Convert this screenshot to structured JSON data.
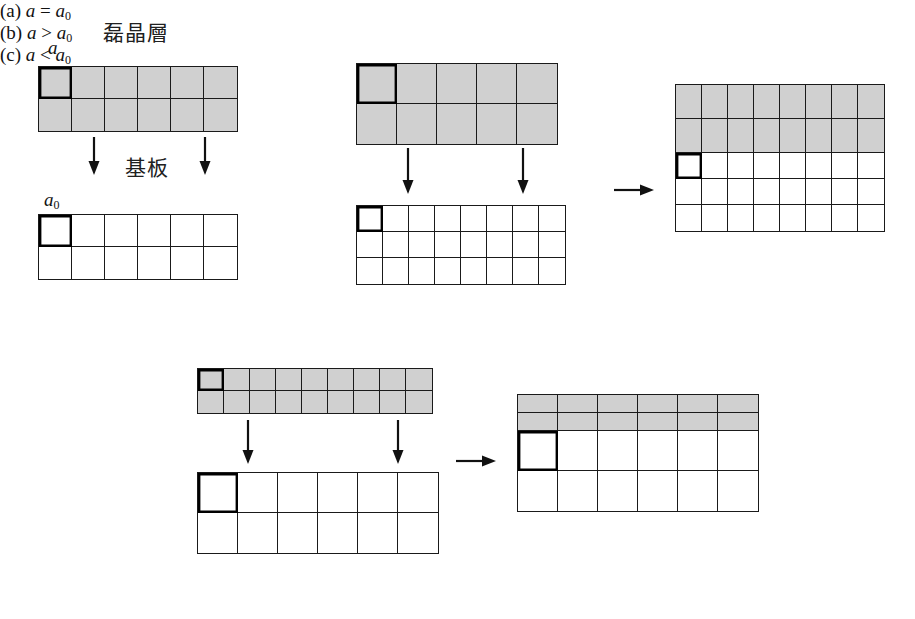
{
  "figure": {
    "labels": {
      "epilayer": "磊晶層",
      "substrate": "基板",
      "a": "a",
      "a0": "a",
      "a0_sub": "0"
    },
    "captions": {
      "a": {
        "tag": "(a)",
        "expr_left": "a",
        "op": "=",
        "expr_right": "a",
        "sub": "0"
      },
      "b": {
        "tag": "(b)",
        "expr_left": "a",
        "op": ">",
        "expr_right": "a",
        "sub": "0"
      },
      "c": {
        "tag": "(c)",
        "expr_left": "a",
        "op": "<",
        "expr_right": "a",
        "sub": "0"
      }
    },
    "colors": {
      "epilayer_fill": "#d0d0d0",
      "substrate_fill": "#ffffff",
      "line": "#1a1a1a",
      "marked_cell_outline": "#000000",
      "background": "#ffffff"
    },
    "panels": [
      {
        "id": "a",
        "caption": "(a) a = a0",
        "meaning": "lattice matched epitaxy",
        "grids": [
          {
            "role": "epilayer",
            "cols": 6,
            "rows": 2,
            "fill": "gray",
            "cell_w": 33,
            "cell_h": 32,
            "marked_cell": [
              0,
              0
            ],
            "x": 38,
            "y": 66
          },
          {
            "role": "substrate",
            "cols": 6,
            "rows": 2,
            "fill": "white",
            "cell_w": 33,
            "cell_h": 32,
            "marked_cell": [
              0,
              0
            ],
            "x": 38,
            "y": 214
          }
        ],
        "arrows": [
          {
            "type": "down",
            "x": 86,
            "y": 137,
            "len": 38
          },
          {
            "type": "down",
            "x": 197,
            "y": 137,
            "len": 38
          }
        ]
      },
      {
        "id": "b",
        "caption": "(b) a > a0",
        "meaning": "epilayer lattice larger than substrate, compressive strain",
        "grids": [
          {
            "role": "epilayer",
            "cols": 5,
            "rows": 2,
            "fill": "gray",
            "cell_w": 40,
            "cell_h": 40,
            "marked_cell": [
              0,
              0
            ],
            "x": 356,
            "y": 63
          },
          {
            "role": "substrate",
            "cols": 8,
            "rows": 3,
            "fill": "white",
            "cell_w": 26,
            "cell_h": 26,
            "marked_cell": [
              0,
              0
            ],
            "x": 356,
            "y": 205
          },
          {
            "role": "result",
            "cols": 8,
            "rows": 5,
            "gray_rows": 2,
            "cell_w": 26,
            "cell_h": 26,
            "gray_cell_h": 34,
            "marked_cell": [
              2,
              0
            ],
            "x": 675,
            "y": 84
          }
        ],
        "arrows": [
          {
            "type": "down",
            "x": 400,
            "y": 148,
            "len": 46
          },
          {
            "type": "down",
            "x": 515,
            "y": 148,
            "len": 46
          },
          {
            "type": "right",
            "x": 614,
            "y": 182,
            "len": 40
          }
        ]
      },
      {
        "id": "c",
        "caption": "(c) a < a0",
        "meaning": "epilayer lattice smaller than substrate, tensile strain",
        "grids": [
          {
            "role": "epilayer",
            "cols": 9,
            "rows": 2,
            "fill": "gray",
            "cell_w": 26,
            "cell_h": 22,
            "marked_cell": [
              0,
              0
            ],
            "x": 197,
            "y": 368
          },
          {
            "role": "substrate",
            "cols": 6,
            "rows": 2,
            "fill": "white",
            "cell_w": 40,
            "cell_h": 40,
            "marked_cell": [
              0,
              0
            ],
            "x": 197,
            "y": 472
          },
          {
            "role": "result",
            "cols": 6,
            "rows": 4,
            "gray_rows": 2,
            "cell_w": 40,
            "cell_h": 40,
            "gray_cell_h": 18,
            "marked_cell": [
              2,
              0
            ],
            "x": 517,
            "y": 394
          }
        ],
        "arrows": [
          {
            "type": "down",
            "x": 240,
            "y": 420,
            "len": 44
          },
          {
            "type": "down",
            "x": 390,
            "y": 420,
            "len": 44
          },
          {
            "type": "right",
            "x": 456,
            "y": 453,
            "len": 40
          }
        ]
      }
    ]
  }
}
